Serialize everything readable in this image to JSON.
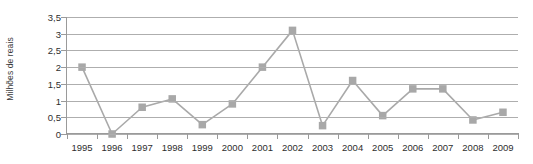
{
  "chart_data": {
    "type": "line",
    "title": "",
    "xlabel": "",
    "ylabel": "Milhões de reais",
    "categories": [
      "1995",
      "1996",
      "1997",
      "1998",
      "1999",
      "2000",
      "2001",
      "2002",
      "2003",
      "2004",
      "2005",
      "2006",
      "2007",
      "2008",
      "2009"
    ],
    "values": [
      2.0,
      0.0,
      0.8,
      1.05,
      0.28,
      0.9,
      2.0,
      3.1,
      0.25,
      1.6,
      0.55,
      1.35,
      1.35,
      0.42,
      0.65
    ],
    "series": [
      {
        "name": "Milhões de reais",
        "values": [
          2.0,
          0.0,
          0.8,
          1.05,
          0.28,
          0.9,
          2.0,
          3.1,
          0.25,
          1.6,
          0.55,
          1.35,
          1.35,
          0.42,
          0.65
        ]
      }
    ],
    "ylim": [
      0,
      3.5
    ],
    "ytick_values": [
      0,
      0.5,
      1,
      1.5,
      2,
      2.5,
      3,
      3.5
    ],
    "ytick_labels": [
      "0",
      "0,5",
      "1",
      "1,5",
      "2",
      "2,5",
      "3",
      "3,5"
    ],
    "grid": true,
    "legend": "none",
    "marker": "square",
    "decimal_separator": ",",
    "colors": {
      "line": "#a9a9a9",
      "marker": "#a8a8a8",
      "grid": "#aeaeae",
      "axis": "#9a9a9a",
      "text": "#2e2e2e",
      "background": "#ffffff"
    }
  }
}
